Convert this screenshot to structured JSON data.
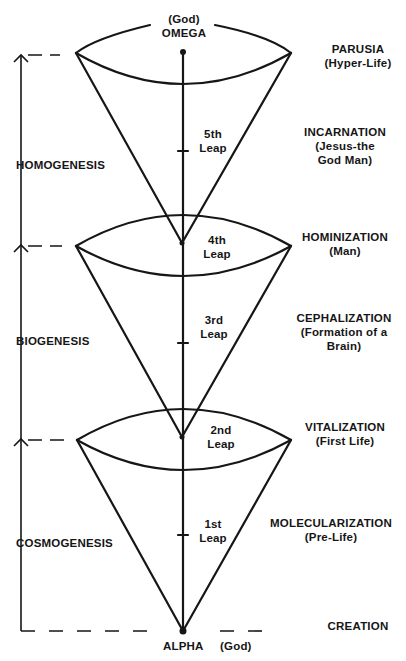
{
  "top_node": {
    "line1": "(God)",
    "line2": "OMEGA"
  },
  "bottom_node": {
    "name": "ALPHA",
    "note": "(God)"
  },
  "eras": [
    {
      "label": "HOMOGENESIS"
    },
    {
      "label": "BIOGENESIS"
    },
    {
      "label": "COSMOGENESIS"
    }
  ],
  "leaps": [
    {
      "line1": "5th",
      "line2": "Leap"
    },
    {
      "line1": "4th",
      "line2": "Leap"
    },
    {
      "line1": "3rd",
      "line2": "Leap"
    },
    {
      "line1": "2nd",
      "line2": "Leap"
    },
    {
      "line1": "1st",
      "line2": "Leap"
    }
  ],
  "stages": [
    {
      "title": "PARUSIA",
      "sub1": "(Hyper-Life)",
      "sub2": ""
    },
    {
      "title": "INCARNATION",
      "sub1": "(Jesus-the",
      "sub2": "God Man)"
    },
    {
      "title": "HOMINIZATION",
      "sub1": "(Man)",
      "sub2": ""
    },
    {
      "title": "CEPHALIZATION",
      "sub1": "(Formation of a",
      "sub2": "Brain)"
    },
    {
      "title": "VITALIZATION",
      "sub1": "(First Life)",
      "sub2": ""
    },
    {
      "title": "MOLECULARIZATION",
      "sub1": "(Pre-Life)",
      "sub2": ""
    },
    {
      "title": "CREATION",
      "sub1": "",
      "sub2": ""
    }
  ],
  "colors": {
    "ink": "#161616",
    "background": "#ffffff"
  }
}
